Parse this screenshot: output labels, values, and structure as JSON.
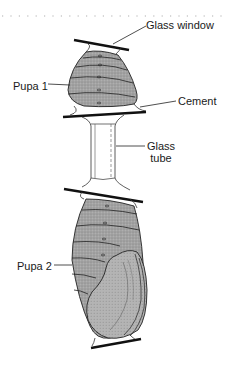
{
  "figure": {
    "labels": {
      "glass_window": "Glass window",
      "pupa1": "Pupa 1",
      "cement": "Cement",
      "glass_tube_line1": "Glass",
      "glass_tube_line2": "tube",
      "pupa2": "Pupa 2"
    },
    "colors": {
      "pupa_fill": "#9a9a9a",
      "line": "#111111",
      "background": "#ffffff"
    }
  }
}
